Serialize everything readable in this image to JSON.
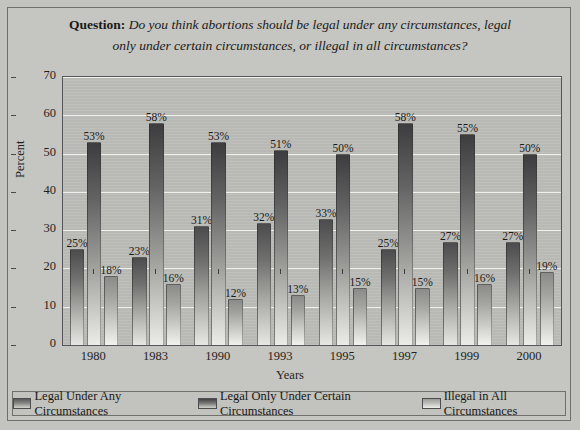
{
  "title": {
    "label": "Question:",
    "line1": "Do you think abortions should be legal under any circumstances, legal",
    "line2": "only under certain circumstances, or illegal in all circumstances?"
  },
  "axes": {
    "ylabel": "Percent",
    "xlabel": "Years",
    "yticks": [
      "0",
      "10",
      "20",
      "30",
      "40",
      "50",
      "60",
      "70"
    ]
  },
  "legend": {
    "items": [
      {
        "label": "Legal Under Any Circumstances",
        "color": "#6a6a69"
      },
      {
        "label": "Legal Only Under Certain Circumstances",
        "color": "#4a4a4c"
      },
      {
        "label": "Illegal in All Circumstances",
        "color": "#b0b0ac"
      }
    ]
  },
  "chart_data": {
    "type": "bar",
    "title": "Question: Do you think abortions should be legal under any circumstances, legal only under certain circumstances, or illegal in all circumstances?",
    "xlabel": "Years",
    "ylabel": "Percent",
    "ylim": [
      0,
      70
    ],
    "ytick_step": 10,
    "grid": true,
    "legend_position": "bottom",
    "categories": [
      "1980",
      "1983",
      "1990",
      "1993",
      "1995",
      "1997",
      "1999",
      "2000"
    ],
    "series": [
      {
        "name": "Legal Under Any Circumstances",
        "values": [
          25,
          23,
          31,
          32,
          33,
          25,
          27,
          27
        ],
        "labels": [
          "25%",
          "23%",
          "31%",
          "32%",
          "33%",
          "25%",
          "27%",
          "27%"
        ]
      },
      {
        "name": "Legal Only Under Certain Circumstances",
        "values": [
          53,
          58,
          53,
          51,
          50,
          58,
          55,
          50
        ],
        "labels": [
          "53%",
          "58%",
          "53%",
          "51%",
          "50%",
          "58%",
          "55%",
          "50%"
        ]
      },
      {
        "name": "Illegal in All Circumstances",
        "values": [
          18,
          16,
          12,
          13,
          15,
          15,
          16,
          19
        ],
        "labels": [
          "18%",
          "16%",
          "12%",
          "13%",
          "15%",
          "15%",
          "16%",
          "19%"
        ]
      }
    ]
  }
}
